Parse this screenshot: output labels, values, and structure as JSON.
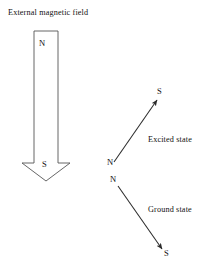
{
  "figure": {
    "title": "External magnetic field",
    "background_color": "#ffffff",
    "stroke_color": "#555555",
    "arrow_color": "#2b2b2b",
    "text_color": "#111111"
  },
  "magnet": {
    "name": "external-magnetic-field-arrow",
    "direction": "down",
    "north_label": "N",
    "south_label": "S",
    "body": {
      "x": 34,
      "y": 31,
      "width": 24,
      "height": 132
    },
    "head": {
      "left": 22,
      "right": 70,
      "shoulder_y": 163,
      "tip_x": 46,
      "tip_y": 181
    }
  },
  "states": [
    {
      "name": "excited-state",
      "label": "Excited state",
      "north_label": "N",
      "south_label": "S",
      "arrow": {
        "x1": 114,
        "y1": 162,
        "x2": 157,
        "y2": 100
      }
    },
    {
      "name": "ground-state",
      "label": "Ground state",
      "north_label": "N",
      "south_label": "S",
      "arrow": {
        "x1": 118,
        "y1": 186,
        "x2": 162,
        "y2": 249
      }
    }
  ],
  "chart_data": {
    "type": "diagram",
    "title": "External magnetic field",
    "elements": [
      {
        "label": "External magnetic field",
        "kind": "field-arrow",
        "direction": "down",
        "poles": [
          "N",
          "S"
        ]
      },
      {
        "label": "Excited state",
        "kind": "dipole-arrow",
        "direction": "up-right",
        "poles": [
          "N",
          "S"
        ]
      },
      {
        "label": "Ground state",
        "kind": "dipole-arrow",
        "direction": "down-right",
        "poles": [
          "N",
          "S"
        ]
      }
    ]
  }
}
